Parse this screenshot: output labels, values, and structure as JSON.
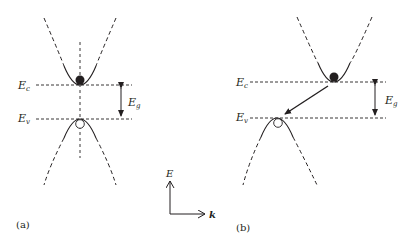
{
  "diagram": {
    "colors": {
      "ink": "#231f20",
      "background": "#ffffff"
    },
    "panels": [
      {
        "id": "a",
        "label": "(a)",
        "type": "direct-bandgap",
        "ec_label": {
          "main": "E",
          "sub": "c"
        },
        "ev_label": {
          "main": "E",
          "sub": "v"
        },
        "eg_label": {
          "main": "E",
          "sub": "g"
        },
        "electron": "filled-circle",
        "hole": "open-circle"
      },
      {
        "id": "b",
        "label": "(b)",
        "type": "indirect-bandgap",
        "ec_label": {
          "main": "E",
          "sub": "c"
        },
        "ev_label": {
          "main": "E",
          "sub": "v"
        },
        "eg_label": {
          "main": "E",
          "sub": "g"
        },
        "electron": "filled-circle",
        "hole": "open-circle",
        "transition": "arrow from conduction minimum to valence maximum"
      }
    ],
    "axes": {
      "y_label": "E",
      "x_label": "k"
    }
  }
}
